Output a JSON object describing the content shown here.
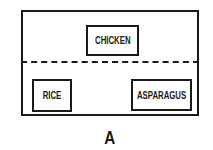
{
  "diagram": {
    "zones": {
      "top": {
        "items": [
          {
            "label": "CHICKEN"
          }
        ]
      },
      "bottom": {
        "items": [
          {
            "label": "RICE"
          },
          {
            "label": "ASPARAGUS"
          }
        ]
      }
    },
    "divider_style": "dashed",
    "caption": "A",
    "colors": {
      "stroke": "#1a1a1a",
      "background": "#ffffff"
    }
  }
}
